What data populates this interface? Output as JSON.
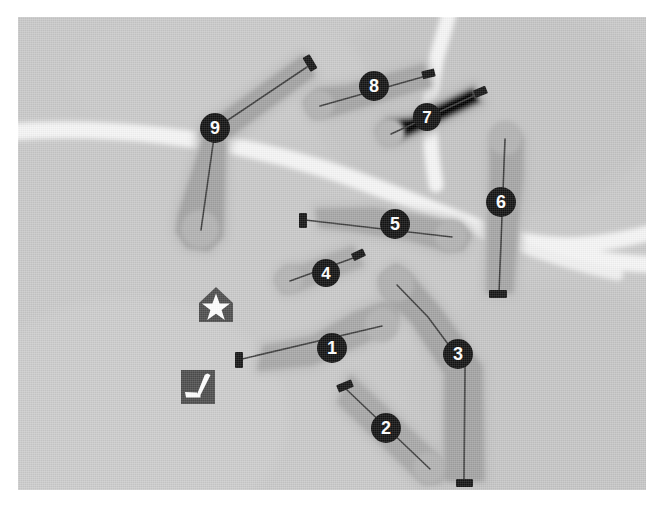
{
  "map": {
    "title": "Golf Course Layout Map",
    "width": 662,
    "height": 517,
    "frame": {
      "x": 18,
      "y": 17,
      "width": 628,
      "height": 473
    },
    "colors": {
      "page_background": "#ffffff",
      "terrain_background": "#c9c9c9",
      "rough": "#b8b8b8",
      "fairway": "#a5a5a5",
      "green": "#b0b0b0",
      "cart_path": "#f4f4f4",
      "centerline": "#3a3a3a",
      "tee_marker": "#1a1a1a",
      "badge_fill": "#141414",
      "badge_text": "#ffffff",
      "amenity_icon_fill": "#4a4a4a",
      "amenity_icon_glyph": "#ffffff"
    }
  },
  "paths": [
    {
      "name": "main-cart-path-west",
      "label": "cart path"
    },
    {
      "name": "main-cart-path-east",
      "label": "cart path"
    },
    {
      "name": "cart-path-branch-north",
      "label": "cart path"
    }
  ],
  "amenities": [
    {
      "id": "clubhouse",
      "name": "clubhouse-marker",
      "icon": "star-in-house-icon",
      "glyph": "★",
      "label": "Clubhouse",
      "x": 198,
      "y": 288
    },
    {
      "id": "practice-green",
      "name": "practice-green-marker",
      "icon": "golf-putter-icon",
      "glyph": "⛳",
      "label": "Practice Green",
      "x": 180,
      "y": 370
    }
  ],
  "holes": [
    {
      "number": "1",
      "name": "hole-1",
      "badge": {
        "x": 314,
        "y": 331,
        "r": 15
      },
      "tee": {
        "x": 221,
        "y": 342,
        "w": 7,
        "h": 15,
        "angle": 0
      },
      "green": {
        "x": 364,
        "y": 308,
        "r": 17
      },
      "centerline": "M 224 342 L 364 309",
      "fairway": "M 242 351 L 294 346 L 344 325 L 371 311 L 379 300 L 377 289 L 366 287 L 338 297 L 296 321 L 247 331 Z"
    },
    {
      "number": "2",
      "name": "hole-2",
      "badge": {
        "x": 368,
        "y": 411,
        "r": 15
      },
      "tee": {
        "x": 326,
        "y": 369,
        "w": 15,
        "h": 7,
        "angle": -22
      },
      "green": {
        "x": 411,
        "y": 451,
        "r": 16
      },
      "centerline": "M 328 372 L 412 452",
      "fairway": "M 333 361 L 418 439 L 427 452 L 421 464 L 407 465 L 395 455 L 322 385 Z"
    },
    {
      "number": "3",
      "name": "hole-3",
      "badge": {
        "x": 440,
        "y": 337,
        "r": 15
      },
      "tee": {
        "x": 446,
        "y": 466,
        "w": 16,
        "h": 7,
        "angle": 0
      },
      "green": {
        "x": 378,
        "y": 267,
        "r": 18
      },
      "centerline": "M 446 464 L 447 350 L 410 300 L 379 268",
      "fairway": "M 429 462 L 429 356 L 395 304 L 368 277 L 364 261 L 378 250 L 392 260 L 420 292 L 462 350 L 464 462 Z"
    },
    {
      "number": "4",
      "name": "hole-4",
      "badge": {
        "x": 308,
        "y": 256,
        "r": 14
      },
      "tee": {
        "x": 340,
        "y": 238,
        "w": 12,
        "h": 7,
        "angle": -25
      },
      "green": {
        "x": 271,
        "y": 263,
        "r": 14
      },
      "centerline": "M 338 240 L 272 264",
      "fairway": "M 334 231 L 284 250 L 268 251 L 259 262 L 266 274 L 281 272 L 343 248 Z"
    },
    {
      "number": "5",
      "name": "hole-5",
      "badge": {
        "x": 377,
        "y": 207,
        "r": 15
      },
      "tee": {
        "x": 284,
        "y": 203,
        "w": 7,
        "h": 14,
        "angle": 0
      },
      "green": {
        "x": 433,
        "y": 219,
        "r": 16
      },
      "centerline": "M 287 203 L 434 220",
      "fairway": "M 300 194 L 356 193 L 410 203 L 441 209 L 451 219 L 444 231 L 428 232 L 392 221 L 336 212 L 303 208 Z"
    },
    {
      "number": "6",
      "name": "hole-6",
      "badge": {
        "x": 483,
        "y": 185,
        "r": 15
      },
      "tee": {
        "x": 479,
        "y": 277,
        "w": 17,
        "h": 7,
        "angle": 0
      },
      "green": {
        "x": 487,
        "y": 121,
        "r": 17
      },
      "centerline": "M 481 276 L 484 200 L 487 122",
      "fairway": "M 471 274 L 472 205 L 474 160 L 474 132 L 479 117 L 493 112 L 503 122 L 503 158 L 498 206 L 493 274 Z"
    },
    {
      "number": "7",
      "name": "hole-7",
      "badge": {
        "x": 409,
        "y": 100,
        "r": 14
      },
      "tee": {
        "x": 462,
        "y": 75,
        "w": 12,
        "h": 7,
        "angle": -22
      },
      "green": {
        "x": 372,
        "y": 116,
        "r": 15
      },
      "centerline": "M 460 77 L 373 117",
      "fairway": "M 456 68 L 392 99 L 369 101 L 359 113 L 367 127 L 383 125 L 465 86 Z"
    },
    {
      "number": "8",
      "name": "hole-8",
      "badge": {
        "x": 356,
        "y": 69,
        "r": 15
      },
      "tee": {
        "x": 410,
        "y": 57,
        "w": 12,
        "h": 7,
        "angle": -14
      },
      "green": {
        "x": 301,
        "y": 88,
        "r": 15
      },
      "centerline": "M 408 59 L 302 89",
      "fairway": "M 405 49 L 330 70 L 300 73 L 288 85 L 296 99 L 313 98 L 411 68 Z"
    },
    {
      "number": "9",
      "name": "hole-9",
      "badge": {
        "x": 197,
        "y": 111,
        "r": 15
      },
      "tee": {
        "x": 292,
        "y": 46,
        "w": 8,
        "h": 15,
        "angle": -30
      },
      "green": {
        "x": 182,
        "y": 212,
        "r": 19
      },
      "centerline_upper": "M 289 50 L 198 111",
      "centerline_lower": "M 197 113 L 183 213",
      "fairway_upper": "M 285 41 L 205 98 L 189 106 L 184 118 L 196 126 L 212 117 L 294 58 Z",
      "fairway_lower": "M 187 124 L 163 198 L 161 214 L 170 228 L 190 231 L 202 219 L 203 200 L 205 126 Z"
    }
  ],
  "legend": {
    "hole_count": 9,
    "note": ""
  }
}
